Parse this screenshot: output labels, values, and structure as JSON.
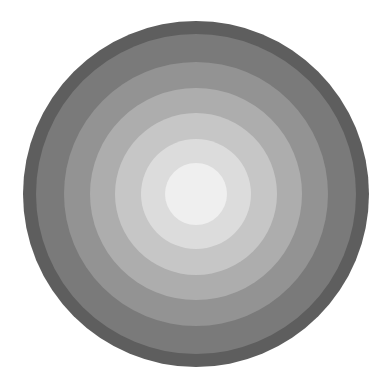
{
  "image": {
    "subject": "concentric gray circles",
    "description": "Grayscale disc composed of concentric rings, lightening from dark gray at the edge to near-white at the center",
    "center": [
      196,
      194
    ],
    "rings": [
      {
        "radius": 173,
        "color": "#5e5e5e"
      },
      {
        "radius": 160,
        "color": "#7a7a7a"
      },
      {
        "radius": 132,
        "color": "#939393"
      },
      {
        "radius": 106,
        "color": "#adadad"
      },
      {
        "radius": 81,
        "color": "#c6c6c6"
      },
      {
        "radius": 55,
        "color": "#dcdcdc"
      },
      {
        "radius": 31,
        "color": "#efefef"
      }
    ]
  }
}
